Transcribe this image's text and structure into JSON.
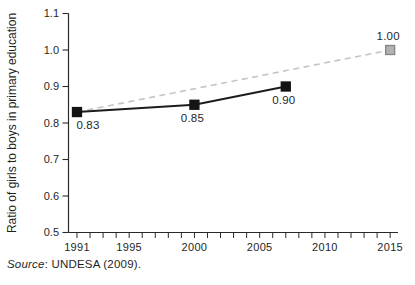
{
  "figure": {
    "source_label": "Source",
    "source_rest": ": UNDESA (2009)."
  },
  "chart_data": {
    "type": "line",
    "title": "",
    "xlabel": "",
    "ylabel": "Ratio of girls to boys in primary education",
    "xlim": [
      1990.35,
      2015.6
    ],
    "ylim": [
      0.5,
      1.1
    ],
    "x_major_ticks": [
      1991,
      1995,
      2000,
      2005,
      2010,
      2015
    ],
    "x_minor_tick_every_years": 1,
    "y_ticks": [
      0.5,
      0.6,
      0.7,
      0.8,
      0.9,
      1.0,
      1.1
    ],
    "grid": false,
    "legend": null,
    "axis_color": "#2a2a2a",
    "text_color": "#1f1f1f",
    "series": [
      {
        "name": "projection-to-target",
        "line_style": "dashed",
        "color": "#c4c4c4",
        "marker": {
          "shape": "square",
          "fill": "#b2b2b2",
          "stroke": "#858585",
          "size": 9
        },
        "points": [
          {
            "x": 1991,
            "y": 0.83,
            "show_marker": false
          },
          {
            "x": 2015,
            "y": 1.0,
            "label": "1.00",
            "label_pos": "above"
          }
        ]
      },
      {
        "name": "observed-ratio",
        "line_style": "solid",
        "color": "#1c1c1c",
        "marker": {
          "shape": "square",
          "fill": "#141414",
          "stroke": "#141414",
          "size": 9
        },
        "points": [
          {
            "x": 1991,
            "y": 0.83,
            "label": "0.83",
            "label_pos": "below-right"
          },
          {
            "x": 2000,
            "y": 0.85,
            "label": "0.85",
            "label_pos": "below"
          },
          {
            "x": 2007,
            "y": 0.9,
            "label": "0.90",
            "label_pos": "below"
          }
        ]
      }
    ],
    "source": "Source: UNDESA (2009)."
  }
}
